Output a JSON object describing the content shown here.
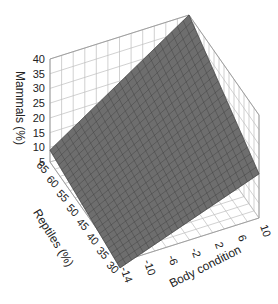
{
  "chart_data": {
    "type": "surface3d",
    "title": "",
    "axes": {
      "x": {
        "label": "Body condition",
        "ticks": [
          "-14",
          "-10",
          "-6",
          "-2",
          "2",
          "6",
          "10"
        ],
        "range": [
          -14,
          10
        ]
      },
      "y": {
        "label": "Reptiles (%)",
        "ticks": [
          "30",
          "35",
          "40",
          "45",
          "50",
          "55",
          "60",
          "65"
        ],
        "range": [
          30,
          65
        ]
      },
      "z": {
        "label": "Mammals (%)",
        "ticks": [
          "5",
          "10",
          "15",
          "20",
          "25",
          "30",
          "35",
          "40"
        ],
        "range": [
          5,
          40
        ]
      }
    },
    "surface": {
      "description": "Planar fitted surface of Mammals (%) as a function of Body condition and Reptiles (%)",
      "corners": [
        {
          "body_condition": -14,
          "reptiles": 65,
          "mammals": 9
        },
        {
          "body_condition": 10,
          "reptiles": 65,
          "mammals": 40
        },
        {
          "body_condition": 10,
          "reptiles": 30,
          "mammals": 20
        },
        {
          "body_condition": -14,
          "reptiles": 30,
          "mammals": 3
        }
      ],
      "color": "#6e6e6e",
      "mesh_color": "#3e3e3e"
    },
    "grid": true,
    "legend": null
  }
}
